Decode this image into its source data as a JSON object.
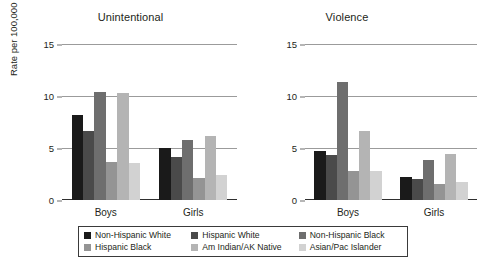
{
  "chart_data": {
    "type": "bar",
    "title": "",
    "ylabel": "Rate per 100,000",
    "xlabel": "",
    "ylim": [
      0,
      15
    ],
    "yticks": [
      "0",
      "5",
      "10",
      "15"
    ],
    "grid": true,
    "legend_position": "bottom",
    "categories": [
      "Boys",
      "Girls"
    ],
    "panels": [
      {
        "title": "Unintentional",
        "categories": [
          "Boys",
          "Girls"
        ],
        "series": [
          {
            "name": "Non-Hispanic White",
            "color": "#1a1a1a",
            "values": [
              8.2,
              5.0
            ]
          },
          {
            "name": "Hispanic White",
            "color": "#4a4a4a",
            "values": [
              6.6,
              4.1
            ]
          },
          {
            "name": "Non-Hispanic Black",
            "color": "#6e6e6e",
            "values": [
              10.4,
              5.8
            ]
          },
          {
            "name": "Hispanic Black",
            "color": "#949494",
            "values": [
              3.7,
              2.1
            ]
          },
          {
            "name": "Am Indian/AK Native",
            "color": "#b4b4b4",
            "values": [
              10.3,
              6.2
            ]
          },
          {
            "name": "Asian/Pac Islander",
            "color": "#d2d2d2",
            "values": [
              3.6,
              2.4
            ]
          }
        ]
      },
      {
        "title": "Violence",
        "categories": [
          "Boys",
          "Girls"
        ],
        "series": [
          {
            "name": "Non-Hispanic White",
            "color": "#1a1a1a",
            "values": [
              4.7,
              2.2
            ]
          },
          {
            "name": "Hispanic White",
            "color": "#4a4a4a",
            "values": [
              4.3,
              2.0
            ]
          },
          {
            "name": "Non-Hispanic Black",
            "color": "#6e6e6e",
            "values": [
              11.3,
              3.8
            ]
          },
          {
            "name": "Hispanic Black",
            "color": "#949494",
            "values": [
              2.8,
              1.5
            ]
          },
          {
            "name": "Am Indian/AK Native",
            "color": "#b4b4b4",
            "values": [
              6.6,
              4.4
            ]
          },
          {
            "name": "Asian/Pac Islander",
            "color": "#d2d2d2",
            "values": [
              2.8,
              1.7
            ]
          }
        ]
      }
    ],
    "legend": [
      {
        "label": "Non-Hispanic White",
        "color": "#1a1a1a"
      },
      {
        "label": "Hispanic White",
        "color": "#4a4a4a"
      },
      {
        "label": "Non-Hispanic Black",
        "color": "#6e6e6e"
      },
      {
        "label": "Hispanic Black",
        "color": "#949494"
      },
      {
        "label": "Am Indian/AK Native",
        "color": "#b4b4b4"
      },
      {
        "label": "Asian/Pac Islander",
        "color": "#d2d2d2"
      }
    ]
  }
}
